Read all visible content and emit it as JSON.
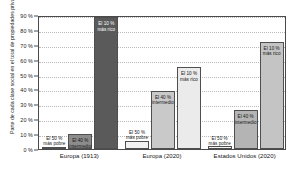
{
  "chart_data": {
    "type": "bar",
    "title": "",
    "subtitle": "",
    "xlabel": "",
    "ylabel": "Parte de cada clase social en el total de propiedades privadas",
    "ylim": [
      0,
      90
    ],
    "ytick_labels": [
      "0 %",
      "10 %",
      "20 %",
      "30 %",
      "40 %",
      "50 %",
      "60 %",
      "70 %",
      "80 %",
      "90 %"
    ],
    "ytick_values": [
      0,
      10,
      20,
      30,
      40,
      50,
      60,
      70,
      80,
      90
    ],
    "grid": true,
    "legend_position": "none",
    "categories": [
      "Europa (1913)",
      "Europa (2020)",
      "Estados Unidos (2020)"
    ],
    "series": [
      {
        "name": "El 50 % más pobre",
        "label_line1": "El 50 %",
        "label_line2": "más pobre",
        "values": [
          1.5,
          5.5,
          1.8
        ],
        "colors": [
          "#f2f2f2",
          "#f2f2f2",
          "#f2f2f2"
        ]
      },
      {
        "name": "El 40 % intermedio",
        "label_line1": "El 40 %",
        "label_line2": "intermedio",
        "values": [
          10.0,
          39.0,
          26.0
        ],
        "colors": [
          "#8c8c8c",
          "#c9c9c9",
          "#b4b4b4"
        ]
      },
      {
        "name": "El 10 % más rico",
        "label_line1": "El 10 %",
        "label_line2": "más rico",
        "values": [
          88.5,
          55.0,
          72.0
        ],
        "colors": [
          "#5a5a5a",
          "#ebebeb",
          "#c4c4c4"
        ]
      }
    ],
    "accent_color": "#5a5a5a",
    "axis_color": "#4a4a4a",
    "grid_color": "#b9b9b9",
    "background_color": "#ffffff"
  }
}
